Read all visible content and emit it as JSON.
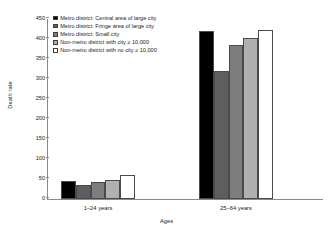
{
  "chart_data": {
    "type": "bar",
    "title": "",
    "xlabel": "Ages",
    "ylabel": "Death rate",
    "categories": [
      "1–24 years",
      "25–64 years"
    ],
    "ylim": [
      0,
      450
    ],
    "yticks": [
      0,
      50,
      100,
      150,
      200,
      250,
      300,
      350,
      400,
      450
    ],
    "grid": false,
    "legend_position": "upper-left",
    "series": [
      {
        "name": "Metro district: Central area of large city",
        "color": "#000000",
        "values": [
          45,
          421
        ]
      },
      {
        "name": "Metro district: Fringe area of large city",
        "color": "#5e5e5e",
        "values": [
          36,
          321
        ]
      },
      {
        "name": "Metro district: Small city",
        "color": "#7d7d7d",
        "values": [
          42,
          386
        ]
      },
      {
        "name": "Non-metro district with city ≥ 10,000",
        "color": "#b0b0b0",
        "values": [
          47,
          402
        ]
      },
      {
        "name": "Non-metro district with no city  ≥ 10,000",
        "color": "#ffffff",
        "values": [
          59,
          423
        ]
      }
    ]
  }
}
